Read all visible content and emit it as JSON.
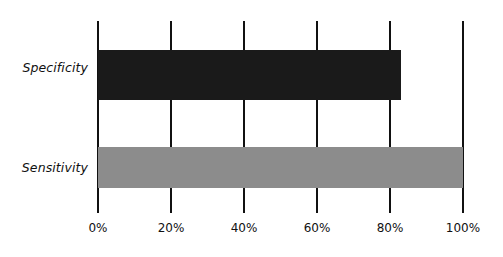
{
  "chart_data": {
    "type": "bar",
    "orientation": "horizontal",
    "title": "",
    "subtitle": "",
    "xlabel": "",
    "ylabel": "",
    "categories": [
      "Specificity",
      "Sensitivity"
    ],
    "values": [
      83,
      100
    ],
    "value_unit": "%",
    "xlim": [
      0,
      100
    ],
    "xticks": [
      0,
      20,
      40,
      60,
      80,
      100
    ],
    "xtick_labels": [
      "0%",
      "20%",
      "40%",
      "60%",
      "80%",
      "100%"
    ],
    "grid": true,
    "grid_axis": "x",
    "legend": false,
    "legend_position": "none",
    "series": [
      {
        "name": "Specificity",
        "value": 83,
        "label": "Specificity",
        "color": "#1a1a1a"
      },
      {
        "name": "Sensitivity",
        "value": 100,
        "label": "Sensitivity",
        "color": "#8c8c8c"
      }
    ],
    "annotations": []
  },
  "colors": {
    "background": "#ffffff",
    "axis": "#111111",
    "gridline": "#111111",
    "text": "#111111",
    "bar_specificity": "#1a1a1a",
    "bar_sensitivity": "#8c8c8c"
  }
}
